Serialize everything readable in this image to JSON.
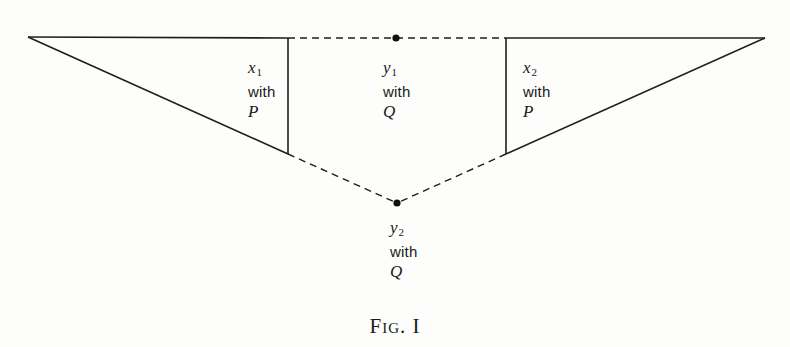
{
  "figure": {
    "caption": "Fig. I",
    "colors": {
      "line": "#1e1e1e",
      "background": "#fdfdfb"
    }
  },
  "nodes": {
    "left_apex": {
      "x": 28,
      "y": 37
    },
    "right_apex": {
      "x": 765,
      "y": 38
    },
    "top_dot": {
      "x": 396,
      "y": 38
    },
    "bottom_dot": {
      "x": 397,
      "y": 203
    },
    "left_vertical_top": {
      "x": 288,
      "y": 38
    },
    "left_vertical_bottom": {
      "x": 288,
      "y": 154
    },
    "right_vertical_top": {
      "x": 506,
      "y": 38
    },
    "right_vertical_bottom": {
      "x": 506,
      "y": 154
    }
  },
  "regions": [
    {
      "id": "x1",
      "var": "x",
      "sub": "1",
      "word": "with",
      "param": "P"
    },
    {
      "id": "y1",
      "var": "y",
      "sub": "1",
      "word": "with",
      "param": "Q"
    },
    {
      "id": "x2",
      "var": "x",
      "sub": "2",
      "word": "with",
      "param": "P"
    },
    {
      "id": "y2",
      "var": "y",
      "sub": "2",
      "word": "with",
      "param": "Q"
    }
  ]
}
